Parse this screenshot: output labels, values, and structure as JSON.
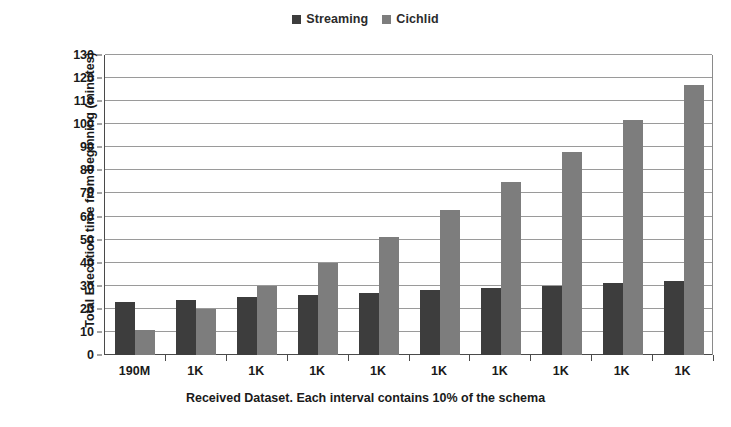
{
  "chart_data": {
    "type": "bar",
    "title": "",
    "xlabel": "Received Dataset. Each interval contains 10% of the schema",
    "ylabel": "Total Execution time from beginning (minutes)",
    "categories": [
      "190M",
      "1K",
      "1K",
      "1K",
      "1K",
      "1K",
      "1K",
      "1K",
      "1K",
      "1K"
    ],
    "series": [
      {
        "name": "Streaming",
        "color": "#3d3d3d",
        "values": [
          23,
          24,
          25,
          26,
          27,
          28,
          29,
          30,
          31,
          32
        ]
      },
      {
        "name": "Cichlid",
        "color": "#7d7d7d",
        "values": [
          11,
          20,
          30,
          40,
          51,
          63,
          75,
          88,
          102,
          117
        ]
      }
    ],
    "ylim": [
      0,
      130
    ],
    "ytick_step": 10,
    "yticks": [
      0,
      10,
      20,
      30,
      40,
      50,
      60,
      70,
      80,
      90,
      100,
      110,
      120,
      130
    ],
    "grid": true,
    "legend_position": "top-center"
  },
  "legend": {
    "entries": [
      {
        "label": "Streaming",
        "color": "#3d3d3d",
        "icon": "square-swatch-icon"
      },
      {
        "label": "Cichlid",
        "color": "#7d7d7d",
        "icon": "square-swatch-icon"
      }
    ]
  }
}
